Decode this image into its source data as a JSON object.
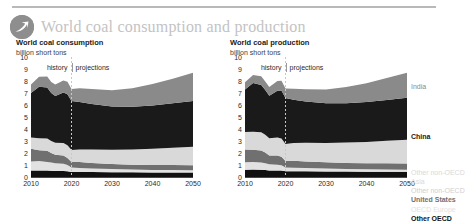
{
  "header": {
    "title": "World coal consumption and production",
    "logo_icon": "eia-swoosh-logo-icon",
    "title_color": "#c3c3c3"
  },
  "panels": [
    {
      "id": "consumption",
      "title": "World coal consumption",
      "subtitle": "billion short tons",
      "history_label": "history",
      "projections_label": "projections",
      "show_legend": false
    },
    {
      "id": "production",
      "title": "World coal production",
      "subtitle": "billion short tons",
      "history_label": "history",
      "projections_label": "projections",
      "show_legend": true
    }
  ],
  "legend": [
    {
      "label": "India",
      "color": "#8a8a8a",
      "faint": true
    },
    {
      "label": "China",
      "color": "#1a1a1a",
      "faint": false
    },
    {
      "label": "Other non-OECD",
      "color": "#d9d9d9",
      "faint": true
    },
    {
      "label": "Asia",
      "color": "#d9d9d9",
      "faint": true
    },
    {
      "label": "Other non-OECD",
      "color": "#cfcfcf",
      "faint": true
    },
    {
      "label": "United States",
      "color": "#707070",
      "faint": false
    },
    {
      "label": "OECD Europe",
      "color": "#e2e2e2",
      "faint": true
    },
    {
      "label": "Other OECD",
      "color": "#111111",
      "faint": false
    }
  ],
  "chart_data": [
    {
      "type": "area",
      "id": "consumption",
      "title": "World coal consumption",
      "subtitle": "billion short tons",
      "xlabel": "",
      "ylabel": "billion short tons",
      "xlim": [
        2010,
        2050
      ],
      "ylim": [
        0,
        10
      ],
      "yticks": [
        0,
        1,
        2,
        3,
        4,
        5,
        6,
        7,
        8,
        9,
        10
      ],
      "xticks": [
        2010,
        2020,
        2030,
        2040,
        2050
      ],
      "grid": false,
      "stacked": true,
      "history_projection_split": 2020,
      "annotations": [
        "history",
        "projections"
      ],
      "x": [
        2010,
        2012,
        2014,
        2015,
        2016,
        2018,
        2019,
        2020,
        2022,
        2025,
        2030,
        2035,
        2040,
        2045,
        2050
      ],
      "series": [
        {
          "name": "Other OECD",
          "color": "#111111",
          "values": [
            0.55,
            0.55,
            0.54,
            0.52,
            0.5,
            0.5,
            0.48,
            0.42,
            0.42,
            0.41,
            0.4,
            0.39,
            0.38,
            0.38,
            0.37
          ]
        },
        {
          "name": "OECD Europe",
          "color": "#e2e2e2",
          "values": [
            0.75,
            0.78,
            0.72,
            0.68,
            0.64,
            0.6,
            0.52,
            0.38,
            0.34,
            0.3,
            0.26,
            0.23,
            0.21,
            0.2,
            0.19
          ]
        },
        {
          "name": "United States",
          "color": "#707070",
          "values": [
            1.05,
            0.9,
            0.92,
            0.8,
            0.72,
            0.69,
            0.58,
            0.44,
            0.48,
            0.46,
            0.42,
            0.4,
            0.4,
            0.41,
            0.42
          ]
        },
        {
          "name": "Other non-OECD",
          "color": "#d9d9d9",
          "values": [
            0.95,
            1.0,
            1.02,
            1.0,
            1.0,
            1.05,
            1.06,
            1.0,
            1.06,
            1.12,
            1.2,
            1.28,
            1.36,
            1.45,
            1.55
          ]
        },
        {
          "name": "China",
          "color": "#1a1a1a",
          "values": [
            3.7,
            4.3,
            4.25,
            4.0,
            3.9,
            4.2,
            4.25,
            4.1,
            3.95,
            3.8,
            3.6,
            3.55,
            3.6,
            3.7,
            3.8
          ]
        },
        {
          "name": "India",
          "color": "#8a8a8a",
          "values": [
            0.7,
            0.82,
            0.92,
            0.92,
            0.94,
            1.0,
            1.04,
            1.0,
            1.15,
            1.25,
            1.35,
            1.55,
            1.8,
            2.05,
            2.35
          ]
        }
      ],
      "stack_totals": [
        7.7,
        8.35,
        8.37,
        7.92,
        7.7,
        8.04,
        7.93,
        7.34,
        7.4,
        7.34,
        7.23,
        7.4,
        7.75,
        8.19,
        8.68
      ]
    },
    {
      "type": "area",
      "id": "production",
      "title": "World coal production",
      "subtitle": "billion short tons",
      "xlabel": "",
      "ylabel": "billion short tons",
      "xlim": [
        2010,
        2050
      ],
      "ylim": [
        0,
        10
      ],
      "yticks": [
        0,
        1,
        2,
        3,
        4,
        5,
        6,
        7,
        8,
        9,
        10
      ],
      "xticks": [
        2010,
        2020,
        2030,
        2040,
        2050
      ],
      "grid": false,
      "stacked": true,
      "history_projection_split": 2020,
      "annotations": [
        "history",
        "projections"
      ],
      "x": [
        2010,
        2012,
        2014,
        2015,
        2016,
        2018,
        2019,
        2020,
        2022,
        2025,
        2030,
        2035,
        2040,
        2045,
        2050
      ],
      "series": [
        {
          "name": "Other OECD",
          "color": "#111111",
          "values": [
            0.6,
            0.62,
            0.6,
            0.58,
            0.55,
            0.55,
            0.54,
            0.48,
            0.48,
            0.47,
            0.46,
            0.45,
            0.44,
            0.44,
            0.43
          ]
        },
        {
          "name": "OECD Europe",
          "color": "#e2e2e2",
          "values": [
            0.62,
            0.64,
            0.6,
            0.56,
            0.52,
            0.48,
            0.44,
            0.32,
            0.3,
            0.27,
            0.24,
            0.22,
            0.2,
            0.19,
            0.18
          ]
        },
        {
          "name": "United States",
          "color": "#707070",
          "values": [
            1.08,
            1.02,
            1.0,
            0.9,
            0.73,
            0.76,
            0.7,
            0.54,
            0.58,
            0.56,
            0.52,
            0.5,
            0.5,
            0.51,
            0.52
          ]
        },
        {
          "name": "Other non-OECD",
          "color": "#d9d9d9",
          "values": [
            1.45,
            1.5,
            1.52,
            1.48,
            1.42,
            1.5,
            1.52,
            1.4,
            1.48,
            1.55,
            1.62,
            1.7,
            1.78,
            1.88,
            1.98
          ]
        },
        {
          "name": "China",
          "color": "#1a1a1a",
          "values": [
            3.55,
            4.05,
            3.95,
            3.72,
            3.55,
            3.9,
            4.0,
            3.85,
            3.6,
            3.45,
            3.3,
            3.28,
            3.32,
            3.4,
            3.5
          ]
        },
        {
          "name": "India",
          "color": "#8a8a8a",
          "values": [
            0.6,
            0.66,
            0.72,
            0.72,
            0.73,
            0.8,
            0.82,
            0.78,
            0.92,
            1.02,
            1.15,
            1.35,
            1.58,
            1.82,
            2.08
          ]
        }
      ],
      "stack_totals": [
        7.9,
        8.49,
        8.39,
        7.96,
        7.5,
        7.99,
        8.02,
        7.37,
        7.36,
        7.32,
        7.29,
        7.5,
        7.82,
        8.24,
        8.69
      ]
    }
  ]
}
